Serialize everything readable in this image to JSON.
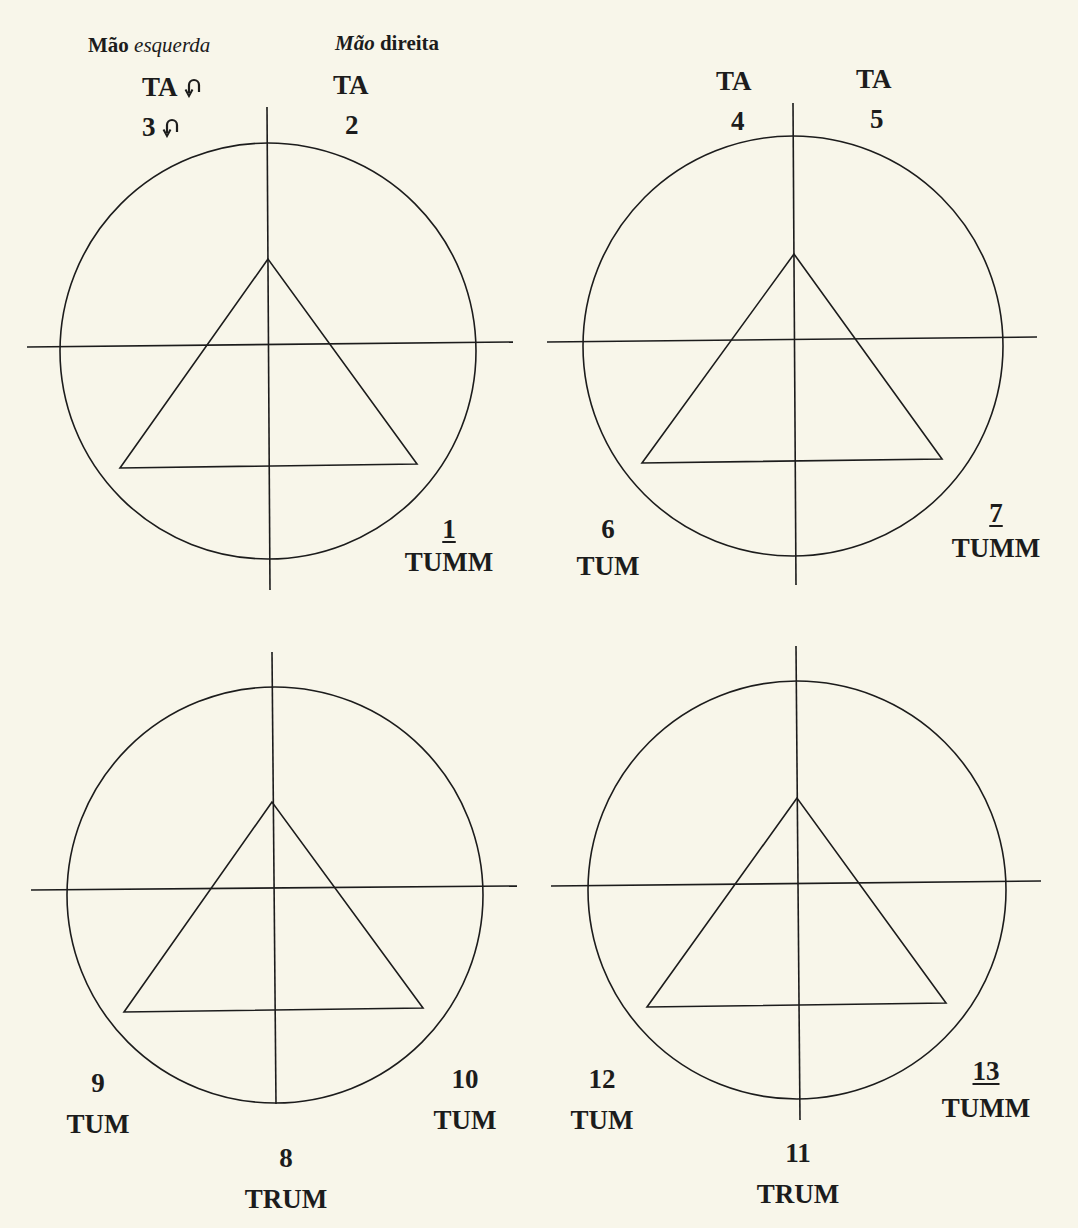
{
  "header": {
    "left_hand": {
      "word1": "Mão",
      "word2": "esquerda"
    },
    "right_hand": {
      "word1": "Mão",
      "word2": "direita"
    }
  },
  "colors": {
    "background": "#f8f6ea",
    "ink": "#1c1c1c"
  },
  "diagrams": [
    {
      "id": "top-left",
      "labels": {
        "ta_left": "TA",
        "ta_right": "TA",
        "num_left": "3",
        "num_right": "2",
        "bottom_right_num": "1",
        "bottom_right_word": "TUMM"
      },
      "icons": [
        "curved-arrow-icon",
        "curved-arrow-icon"
      ]
    },
    {
      "id": "top-right",
      "labels": {
        "ta_left": "TA",
        "ta_right": "TA",
        "num_left": "4",
        "num_right": "5",
        "bottom_left_num": "6",
        "bottom_left_word": "TUM",
        "bottom_right_num": "7",
        "bottom_right_word": "TUMM"
      }
    },
    {
      "id": "bottom-left",
      "labels": {
        "bottom_left_num": "9",
        "bottom_left_word": "TUM",
        "bottom_right_num": "10",
        "bottom_right_word": "TUM",
        "bottom_center_num": "8",
        "bottom_center_word": "TRUM"
      }
    },
    {
      "id": "bottom-right",
      "labels": {
        "bottom_left_num": "12",
        "bottom_left_word": "TUM",
        "bottom_right_num": "13",
        "bottom_right_word": "TUMM",
        "bottom_center_num": "11",
        "bottom_center_word": "TRUM"
      }
    }
  ]
}
